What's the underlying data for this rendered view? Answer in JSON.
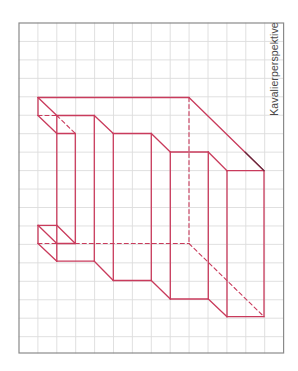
{
  "figure": {
    "label": "Kavalierperspektive",
    "colors": {
      "background": "#ffffff",
      "grid_line": "#dcdcdc",
      "grid_border": "#8a8a8a",
      "drawing": "#c93b5c",
      "label_text": "#4a4a4a"
    },
    "grid": {
      "left": 19,
      "top": 23,
      "right": 283.6,
      "bottom": 353,
      "columns": 14,
      "col_spacing": 18.9,
      "row_spacing": 18.45
    },
    "solid_segments": [
      [
        38,
        97.5,
        189,
        97.5
      ],
      [
        189,
        97.5,
        264,
        170.7
      ],
      [
        38,
        97.5,
        38,
        115.5
      ],
      [
        38,
        97.5,
        56.8,
        115.5
      ],
      [
        38,
        115.5,
        56.8,
        133.5
      ],
      [
        56.8,
        115.5,
        94.3,
        115.5
      ],
      [
        56.8,
        115.5,
        56.8,
        261.2
      ],
      [
        56.8,
        133.5,
        75.3,
        133.5
      ],
      [
        75.3,
        133.5,
        75.3,
        243.5
      ],
      [
        94.3,
        115.5,
        113.3,
        133.5
      ],
      [
        94.3,
        115.5,
        94.3,
        261.2
      ],
      [
        113.3,
        133.5,
        151.3,
        133.5
      ],
      [
        113.3,
        133.5,
        113.3,
        280.5
      ],
      [
        151.3,
        133.5,
        170.3,
        152
      ],
      [
        151.3,
        133.5,
        151.3,
        280.5
      ],
      [
        170.3,
        152,
        208.3,
        152
      ],
      [
        170.3,
        152,
        170.3,
        299
      ],
      [
        208.3,
        152,
        227,
        170.7
      ],
      [
        208.3,
        152,
        208.3,
        299
      ],
      [
        227,
        170.7,
        264,
        170.7
      ],
      [
        227,
        170.7,
        227,
        316.7
      ],
      [
        264,
        170.7,
        264,
        316.7
      ],
      [
        38,
        225.3,
        56.8,
        225.3
      ],
      [
        38,
        225.3,
        38,
        243.5
      ],
      [
        38,
        225.3,
        56.8,
        243.5
      ],
      [
        56.8,
        225.3,
        75.3,
        243.5
      ],
      [
        56.8,
        243.5,
        75.3,
        243.5
      ],
      [
        38,
        243.5,
        56.8,
        261.2
      ],
      [
        56.8,
        261.2,
        94.3,
        261.2
      ],
      [
        94.3,
        261.2,
        113.3,
        280.5
      ],
      [
        113.3,
        280.5,
        151.3,
        280.5
      ],
      [
        151.3,
        280.5,
        170.3,
        299
      ],
      [
        170.3,
        299,
        208.3,
        299
      ],
      [
        208.3,
        299,
        227,
        316.7
      ],
      [
        227,
        316.7,
        264,
        316.7
      ]
    ],
    "dashed_segments": [
      [
        38,
        115.5,
        56.8,
        115.5
      ],
      [
        56.8,
        115.5,
        75.3,
        133.5
      ],
      [
        189,
        97.5,
        189,
        243.5
      ],
      [
        38,
        243.5,
        56.8,
        243.5
      ],
      [
        75.3,
        243.5,
        189,
        243.5
      ],
      [
        189,
        243.5,
        264,
        316.7
      ]
    ],
    "dark_segments": [
      [
        245,
        152,
        264,
        170.7
      ]
    ]
  }
}
